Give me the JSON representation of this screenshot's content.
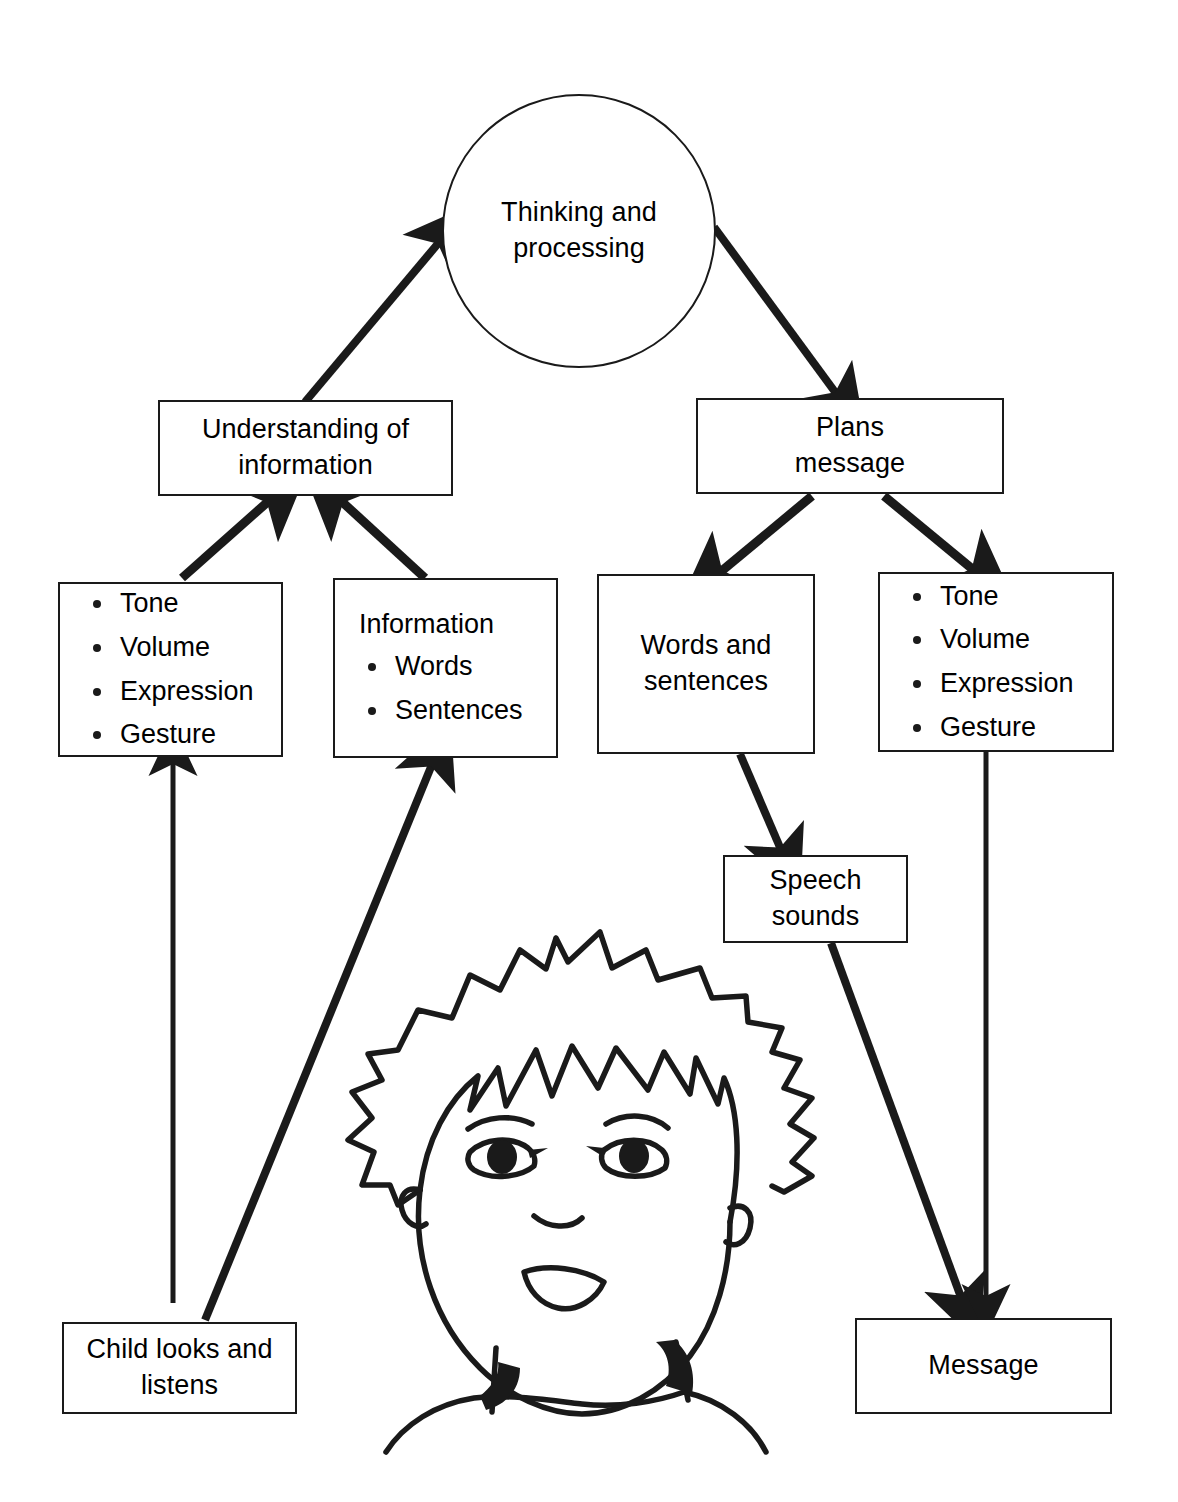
{
  "diagram": {
    "line_color": "#1a1a1a",
    "background_color": "#ffffff",
    "nodes": {
      "thinking": {
        "label": "Thinking and\nprocessing",
        "shape": "circle"
      },
      "understanding": {
        "label": "Understanding of\ninformation",
        "shape": "rectangle"
      },
      "plans": {
        "label": "Plans\nmessage",
        "shape": "rectangle"
      },
      "receptive_paralinguistic": {
        "shape": "rectangle",
        "heading": "",
        "items": [
          "Tone",
          "Volume",
          "Expression",
          "Gesture"
        ]
      },
      "receptive_information": {
        "shape": "rectangle",
        "heading": "Information",
        "items": [
          "Words",
          "Sentences"
        ]
      },
      "expressive_words": {
        "label": "Words and\nsentences",
        "shape": "rectangle"
      },
      "expressive_paralinguistic": {
        "shape": "rectangle",
        "heading": "",
        "items": [
          "Tone",
          "Volume",
          "Expression",
          "Gesture"
        ]
      },
      "speech_sounds": {
        "label": "Speech\nsounds",
        "shape": "rectangle"
      },
      "child": {
        "label": "Child looks and\nlistens",
        "shape": "rectangle"
      },
      "message": {
        "label": "Message",
        "shape": "rectangle"
      }
    },
    "illustration": {
      "name": "child-face-illustration",
      "description": "Line drawing of a smiling child with spiky hair"
    },
    "edges": [
      {
        "from": "understanding",
        "to": "thinking",
        "direction": "up-right"
      },
      {
        "from": "thinking",
        "to": "plans",
        "direction": "down-right"
      },
      {
        "from": "receptive_paralinguistic",
        "to": "understanding",
        "direction": "up-right"
      },
      {
        "from": "receptive_information",
        "to": "understanding",
        "direction": "up-left"
      },
      {
        "from": "plans",
        "to": "expressive_words",
        "direction": "down-left"
      },
      {
        "from": "plans",
        "to": "expressive_paralinguistic",
        "direction": "down-right"
      },
      {
        "from": "expressive_words",
        "to": "speech_sounds",
        "direction": "down-right"
      },
      {
        "from": "child",
        "to": "receptive_paralinguistic",
        "direction": "up"
      },
      {
        "from": "child",
        "to": "receptive_information",
        "direction": "up-right"
      },
      {
        "from": "speech_sounds",
        "to": "message",
        "direction": "down-right"
      },
      {
        "from": "expressive_paralinguistic",
        "to": "message",
        "direction": "down"
      }
    ]
  }
}
